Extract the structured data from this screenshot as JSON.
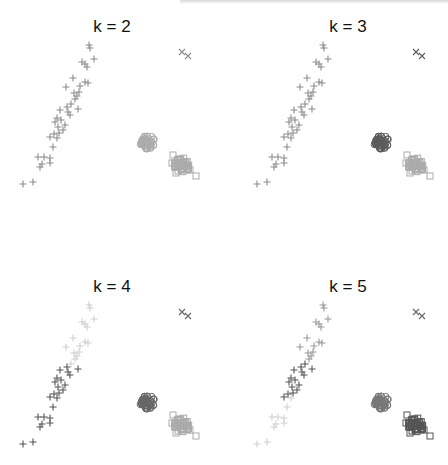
{
  "chart_data": [
    {
      "type": "scatter",
      "title": "k = 2",
      "xlabel": "",
      "ylabel": "",
      "grid": false,
      "clusters": [
        {
          "marker": "plus",
          "color": "#8c8c8c",
          "label": "elongated diagonal group"
        },
        {
          "marker": "circle",
          "color": "#a8a8a8",
          "label": "circle group"
        },
        {
          "marker": "square",
          "color": "#a8a8a8",
          "label": "square group"
        },
        {
          "marker": "x",
          "color": "#8c8c8c",
          "label": "outlier pair"
        }
      ],
      "assignment": {
        "plus": "#8c8c8c",
        "x": "#8c8c8c",
        "circle": "#b0b0b0",
        "square": "#b0b0b0"
      }
    },
    {
      "type": "scatter",
      "title": "k = 3",
      "xlabel": "",
      "ylabel": "",
      "grid": false,
      "assignment": {
        "plus": "#8c8c8c",
        "x": "#5e5e5e",
        "circle": "#5e5e5e",
        "square": "#b0b0b0"
      }
    },
    {
      "type": "scatter",
      "title": "k = 4",
      "xlabel": "",
      "ylabel": "",
      "grid": false,
      "assignment": {
        "plus_upper": "#cfcfcf",
        "plus_lower": "#555555",
        "x": "#6a6a6a",
        "circle": "#6a6a6a",
        "square": "#b0b0b0"
      }
    },
    {
      "type": "scatter",
      "title": "k = 5",
      "xlabel": "",
      "ylabel": "",
      "grid": false,
      "assignment": {
        "plus_upper": "#9a9a9a",
        "plus_middle": "#555555",
        "plus_lower": "#cfcfcf",
        "x": "#6a6a6a",
        "circle": "#7a7a7a",
        "square": "#555555"
      }
    }
  ],
  "panels": [
    {
      "title": "k = 2"
    },
    {
      "title": "k = 3"
    },
    {
      "title": "k = 4"
    },
    {
      "title": "k = 5"
    }
  ],
  "points": {
    "plus": [
      [
        89,
        45
      ],
      [
        90,
        48
      ],
      [
        82,
        62
      ],
      [
        87,
        67
      ],
      [
        85,
        64
      ],
      [
        94,
        59
      ],
      [
        73,
        78
      ],
      [
        66,
        87
      ],
      [
        80,
        86
      ],
      [
        88,
        83
      ],
      [
        85,
        82
      ],
      [
        74,
        93
      ],
      [
        79,
        92
      ],
      [
        75,
        99
      ],
      [
        77,
        96
      ],
      [
        67,
        107
      ],
      [
        71,
        104
      ],
      [
        78,
        109
      ],
      [
        60,
        110
      ],
      [
        70,
        115
      ],
      [
        68,
        112
      ],
      [
        55,
        122
      ],
      [
        58,
        127
      ],
      [
        65,
        125
      ],
      [
        61,
        120
      ],
      [
        57,
        118
      ],
      [
        63,
        130
      ],
      [
        59,
        133
      ],
      [
        50,
        137
      ],
      [
        57,
        138
      ],
      [
        54,
        134
      ],
      [
        53,
        147
      ],
      [
        38,
        157
      ],
      [
        44,
        157
      ],
      [
        50,
        158
      ],
      [
        40,
        167
      ],
      [
        42,
        164
      ],
      [
        50,
        163
      ],
      [
        33,
        182
      ],
      [
        23,
        184
      ]
    ],
    "x": [
      [
        182,
        52
      ],
      [
        188,
        56
      ]
    ],
    "circle_center": [
      147,
      142
    ],
    "square_center": [
      182,
      165
    ],
    "square_outliers": [
      [
        173,
        155
      ],
      [
        172,
        163
      ],
      [
        196,
        176
      ],
      [
        190,
        170
      ],
      [
        176,
        173
      ]
    ]
  }
}
